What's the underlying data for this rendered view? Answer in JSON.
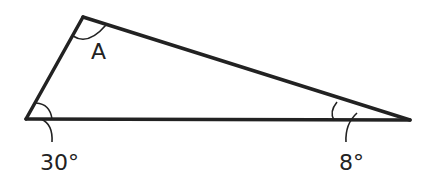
{
  "diagram": {
    "type": "triangle",
    "vertices": {
      "bottom_left": {
        "x": 26,
        "y": 119
      },
      "top": {
        "x": 83,
        "y": 17
      },
      "right": {
        "x": 410,
        "y": 120
      }
    },
    "labels": {
      "top_angle": "A",
      "bottom_left_angle": "30°",
      "right_angle": "8°"
    },
    "colors": {
      "stroke": "#222222",
      "background": "#ffffff"
    }
  }
}
